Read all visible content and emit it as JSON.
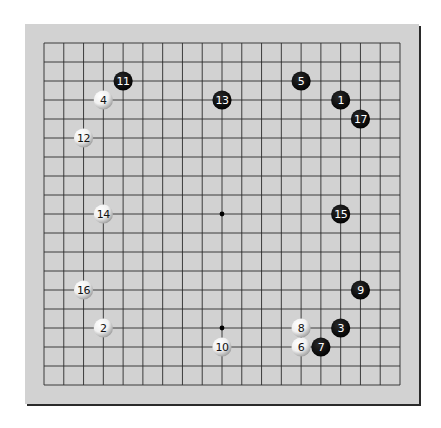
{
  "board": {
    "size": 19,
    "colors": {
      "background": "#ffffff",
      "board_fill": "#d2d2d2",
      "board_shadow": "#2a2a2a",
      "grid_line": "#2b2b2b",
      "star_point": "#000000",
      "black_stone": "#0a0a0a",
      "white_stone_light": "#ffffff",
      "white_stone_dark": "#9a9a9a"
    },
    "star_points_visible": [
      {
        "col": 9,
        "row": 9
      },
      {
        "col": 9,
        "row": 15
      }
    ],
    "stones": [
      {
        "move": "1",
        "color": "black",
        "col": 15,
        "row": 3
      },
      {
        "move": "2",
        "color": "white",
        "col": 3,
        "row": 15
      },
      {
        "move": "3",
        "color": "black",
        "col": 15,
        "row": 15
      },
      {
        "move": "4",
        "color": "white",
        "col": 3,
        "row": 3
      },
      {
        "move": "5",
        "color": "black",
        "col": 13,
        "row": 2
      },
      {
        "move": "6",
        "color": "white",
        "col": 13,
        "row": 16
      },
      {
        "move": "7",
        "color": "black",
        "col": 14,
        "row": 16
      },
      {
        "move": "8",
        "color": "white",
        "col": 13,
        "row": 15
      },
      {
        "move": "9",
        "color": "black",
        "col": 16,
        "row": 13
      },
      {
        "move": "10",
        "color": "white",
        "col": 9,
        "row": 16
      },
      {
        "move": "11",
        "color": "black",
        "col": 4,
        "row": 2
      },
      {
        "move": "12",
        "color": "white",
        "col": 2,
        "row": 5
      },
      {
        "move": "13",
        "color": "black",
        "col": 9,
        "row": 3
      },
      {
        "move": "14",
        "color": "white",
        "col": 3,
        "row": 9
      },
      {
        "move": "15",
        "color": "black",
        "col": 15,
        "row": 9
      },
      {
        "move": "16",
        "color": "white",
        "col": 2,
        "row": 13
      },
      {
        "move": "17",
        "color": "black",
        "col": 16,
        "row": 4
      }
    ]
  }
}
